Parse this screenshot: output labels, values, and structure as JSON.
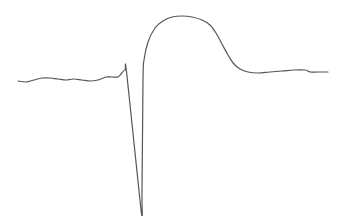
{
  "chart_data": {
    "type": "line",
    "title": "",
    "xlabel": "",
    "ylabel": "",
    "grid": false,
    "legend": null,
    "axes_visible": false,
    "line_color": "#555555",
    "background_color": "#ffffff",
    "series": [
      {
        "name": "waveform",
        "points_px": [
          [
            18,
            81
          ],
          [
            26,
            82
          ],
          [
            34,
            80
          ],
          [
            42,
            78
          ],
          [
            50,
            78
          ],
          [
            58,
            79
          ],
          [
            66,
            80
          ],
          [
            74,
            79
          ],
          [
            82,
            80
          ],
          [
            90,
            81
          ],
          [
            98,
            80
          ],
          [
            106,
            77
          ],
          [
            112,
            77
          ],
          [
            118,
            77
          ],
          [
            121,
            74
          ],
          [
            125,
            70
          ],
          [
            127,
            76
          ],
          [
            141,
            210
          ],
          [
            142,
            190
          ],
          [
            143,
            80
          ],
          [
            144,
            60
          ],
          [
            148,
            42
          ],
          [
            155,
            28
          ],
          [
            163,
            21
          ],
          [
            172,
            17
          ],
          [
            182,
            16
          ],
          [
            192,
            17
          ],
          [
            202,
            20
          ],
          [
            210,
            25
          ],
          [
            216,
            33
          ],
          [
            222,
            44
          ],
          [
            228,
            55
          ],
          [
            234,
            64
          ],
          [
            240,
            69
          ],
          [
            248,
            72
          ],
          [
            258,
            73
          ],
          [
            270,
            72
          ],
          [
            282,
            71
          ],
          [
            294,
            70
          ],
          [
            305,
            70
          ],
          [
            310,
            72
          ],
          [
            318,
            72
          ],
          [
            328,
            72
          ]
        ]
      }
    ]
  }
}
